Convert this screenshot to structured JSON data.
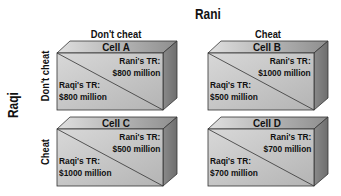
{
  "diagram": {
    "title": "Rani",
    "column_player": "Rani",
    "row_player": "Raqi",
    "columns": [
      "Don't cheat",
      "Cheat"
    ],
    "rows": [
      "Don't cheat",
      "Cheat"
    ],
    "cells": [
      {
        "name": "Cell A",
        "rani_label": "Rani's TR:",
        "rani_value": "$800 million",
        "raqi_label": "Raqi's TR:",
        "raqi_value": "$800 million"
      },
      {
        "name": "Cell B",
        "rani_label": "Rani's TR:",
        "rani_value": "$1000 million",
        "raqi_label": "Raqi's TR:",
        "raqi_value": "$500 million"
      },
      {
        "name": "Cell C",
        "rani_label": "Rani's TR:",
        "rani_value": "$500 million",
        "raqi_label": "Raqi's TR:",
        "raqi_value": "$1000 million"
      },
      {
        "name": "Cell D",
        "rani_label": "Rani's TR:",
        "rani_value": "$700 million",
        "raqi_label": "Raqi's TR:",
        "raqi_value": "$700 million"
      }
    ],
    "colors": {
      "front_face": "#c8c8c8",
      "top_face": "#b0b0b0",
      "side_face": "#8a8a8a",
      "edge": "#333333"
    }
  }
}
